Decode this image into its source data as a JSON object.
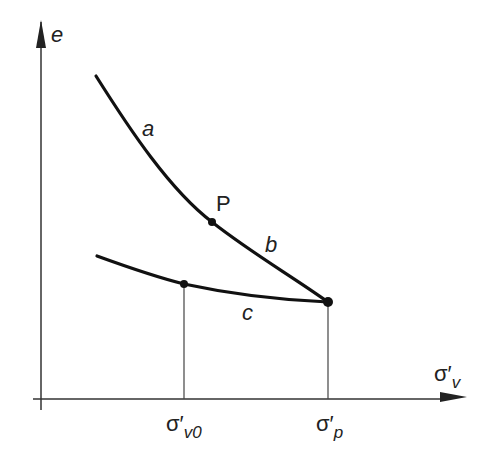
{
  "diagram": {
    "type": "e-log sigma' compression curve",
    "y_axis": {
      "label": "e"
    },
    "x_axis": {
      "label_main": "σ′",
      "label_sub": "v"
    },
    "curves": [
      {
        "id": "a",
        "label": "a",
        "description": "virgin compression (upper part)"
      },
      {
        "id": "b",
        "label": "b",
        "description": "virgin compression (near preconsolidation)"
      },
      {
        "id": "c",
        "label": "c",
        "description": "recompression / unloading curve"
      }
    ],
    "points": [
      {
        "id": "P",
        "label": "P"
      },
      {
        "id": "sv0_point",
        "label": ""
      },
      {
        "id": "sp_point",
        "label": ""
      }
    ],
    "x_ticks": [
      {
        "main": "σ′",
        "sub": "v0"
      },
      {
        "main": "σ′",
        "sub": "p"
      }
    ],
    "colors": {
      "line": "#111111",
      "axis": "#333333",
      "guide": "#444444"
    }
  }
}
